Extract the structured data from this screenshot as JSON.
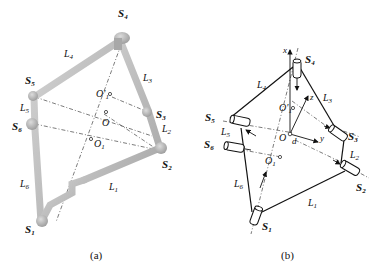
{
  "figure_a": {
    "caption": "(a)",
    "joints": [
      {
        "id": "S1",
        "main": "S",
        "sub": "1"
      },
      {
        "id": "S2",
        "main": "S",
        "sub": "2"
      },
      {
        "id": "S3",
        "main": "S",
        "sub": "3"
      },
      {
        "id": "S4",
        "main": "S",
        "sub": "4"
      },
      {
        "id": "S5",
        "main": "S",
        "sub": "5"
      },
      {
        "id": "S6",
        "main": "S",
        "sub": "6"
      }
    ],
    "links": [
      {
        "id": "L1",
        "main": "L",
        "sub": "1"
      },
      {
        "id": "L2",
        "main": "L",
        "sub": "2"
      },
      {
        "id": "L3",
        "main": "L",
        "sub": "3"
      },
      {
        "id": "L4",
        "main": "L",
        "sub": "4"
      },
      {
        "id": "L5",
        "main": "L",
        "sub": "5"
      },
      {
        "id": "L6",
        "main": "L",
        "sub": "6"
      }
    ],
    "points": [
      {
        "id": "O1p",
        "main": "O'",
        "sub": "1"
      },
      {
        "id": "O",
        "main": "O",
        "sub": ""
      },
      {
        "id": "O1",
        "main": "O",
        "sub": "1"
      }
    ]
  },
  "figure_b": {
    "caption": "(b)",
    "joints": [
      {
        "id": "S1",
        "main": "S",
        "sub": "1"
      },
      {
        "id": "S2",
        "main": "S",
        "sub": "2"
      },
      {
        "id": "S3",
        "main": "S",
        "sub": "3"
      },
      {
        "id": "S4",
        "main": "S",
        "sub": "4"
      },
      {
        "id": "S5",
        "main": "S",
        "sub": "5"
      },
      {
        "id": "S6",
        "main": "S",
        "sub": "6"
      }
    ],
    "links": [
      {
        "id": "L1",
        "main": "L",
        "sub": "1"
      },
      {
        "id": "L2",
        "main": "L",
        "sub": "2"
      },
      {
        "id": "L3",
        "main": "L",
        "sub": "3"
      },
      {
        "id": "L4",
        "main": "L",
        "sub": "4"
      },
      {
        "id": "L5",
        "main": "L",
        "sub": "5"
      },
      {
        "id": "L6",
        "main": "L",
        "sub": "6"
      }
    ],
    "points": [
      {
        "id": "O1p",
        "main": "O'",
        "sub": "1"
      },
      {
        "id": "O",
        "main": "O",
        "sub": ""
      },
      {
        "id": "O1",
        "main": "O",
        "sub": "1"
      }
    ],
    "axes": {
      "x": "x",
      "y": "y",
      "z": "z"
    },
    "offset_label": "d"
  }
}
